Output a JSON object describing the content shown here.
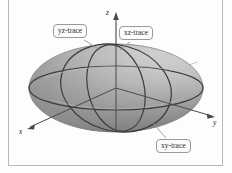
{
  "figure": {
    "surface": "ellipsoid",
    "shading": "grayscale",
    "colors": {
      "surface_light": "#fdfdfd",
      "surface_mid": "#d8d8d8",
      "surface_dark": "#8f8f8f",
      "surface_shadow": "#6b6b6b",
      "trace": "#3c3c3c",
      "axis": "#4a4a4a",
      "frame": "#b9b9b9",
      "label_border": "#9a9a9a",
      "label_fill": "#fbfbfb",
      "label_text": "#2b2b2b"
    },
    "axes": [
      {
        "name": "x-axis",
        "label": "x"
      },
      {
        "name": "y-axis",
        "label": "y"
      },
      {
        "name": "z-axis",
        "label": "z"
      }
    ],
    "callouts": [
      {
        "name": "yz-trace",
        "label": "yz-trace",
        "plane": "yz"
      },
      {
        "name": "xz-trace",
        "label": "xz-trace",
        "plane": "xz"
      },
      {
        "name": "xy-trace",
        "label": "xy-trace",
        "plane": "xy"
      }
    ]
  }
}
